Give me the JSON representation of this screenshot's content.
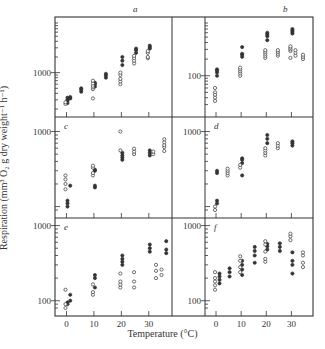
{
  "figure": {
    "ylabel": "Respiration (mm³ O₂ g dry weight⁻¹ h⁻¹)",
    "xlabel": "Temperature (°C)",
    "x_ticks": [
      0,
      10,
      20,
      30
    ],
    "colors": {
      "ink": "#333333",
      "background": "#ffffff"
    }
  },
  "chart_data": [
    {
      "type": "scatter",
      "panel": "a",
      "xlabel": "Temperature (°C)",
      "ylabel": "Respiration",
      "yscale": "log",
      "ylim": [
        200,
        9000
      ],
      "ytick_labels": [
        "1000"
      ],
      "xlim": [
        -2,
        37
      ],
      "series": [
        {
          "name": "filled",
          "points": [
            [
              0,
              260
            ],
            [
              0,
              290
            ],
            [
              0,
              300
            ],
            [
              0,
              330
            ],
            [
              1,
              320
            ],
            [
              1,
              340
            ],
            [
              5,
              430
            ],
            [
              5,
              470
            ],
            [
              5,
              500
            ],
            [
              10,
              540
            ],
            [
              10,
              600
            ],
            [
              10,
              640
            ],
            [
              14,
              800
            ],
            [
              14,
              880
            ],
            [
              14,
              950
            ],
            [
              20,
              1400
            ],
            [
              20,
              1700
            ],
            [
              20,
              2000
            ],
            [
              25,
              2400
            ],
            [
              25,
              2700
            ],
            [
              25,
              2900
            ],
            [
              30,
              2900
            ],
            [
              30,
              3100
            ],
            [
              30,
              3300
            ]
          ]
        },
        {
          "name": "open",
          "points": [
            [
              0,
              250
            ],
            [
              0,
              270
            ],
            [
              10,
              320
            ],
            [
              10,
              480
            ],
            [
              10,
              520
            ],
            [
              10,
              560
            ],
            [
              10,
              620
            ],
            [
              10,
              700
            ],
            [
              20,
              600
            ],
            [
              20,
              680
            ],
            [
              20,
              760
            ],
            [
              20,
              900
            ],
            [
              20,
              1000
            ],
            [
              25,
              1500
            ],
            [
              25,
              1700
            ],
            [
              25,
              1900
            ],
            [
              25,
              2100
            ],
            [
              30,
              1900
            ],
            [
              30,
              2000
            ],
            [
              30,
              2400
            ],
            [
              30,
              2600
            ]
          ]
        }
      ]
    },
    {
      "type": "scatter",
      "panel": "b",
      "xlabel": "Temperature (°C)",
      "ylabel": "Respiration",
      "yscale": "log",
      "ylim": [
        25,
        900
      ],
      "ytick_labels": [
        "100"
      ],
      "xlim": [
        -2,
        37
      ],
      "series": [
        {
          "name": "filled",
          "points": [
            [
              0,
              100
            ],
            [
              0,
              115
            ],
            [
              0,
              125
            ],
            [
              0,
              130
            ],
            [
              10,
              220
            ],
            [
              10,
              240
            ],
            [
              10,
              250
            ],
            [
              10,
              330
            ],
            [
              20,
              520
            ],
            [
              20,
              560
            ],
            [
              20,
              600
            ],
            [
              20,
              440
            ],
            [
              30,
              580
            ],
            [
              30,
              620
            ],
            [
              30,
              660
            ],
            [
              30,
              700
            ]
          ]
        },
        {
          "name": "open",
          "points": [
            [
              0,
              60
            ],
            [
              0,
              50
            ],
            [
              0,
              45
            ],
            [
              0,
              40
            ],
            [
              0,
              35
            ],
            [
              10,
              100
            ],
            [
              10,
              110
            ],
            [
              10,
              120
            ],
            [
              10,
              130
            ],
            [
              10,
              140
            ],
            [
              20,
              210
            ],
            [
              20,
              230
            ],
            [
              20,
              250
            ],
            [
              20,
              270
            ],
            [
              20,
              290
            ],
            [
              25,
              230
            ],
            [
              25,
              250
            ],
            [
              25,
              270
            ],
            [
              25,
              290
            ],
            [
              30,
              210
            ],
            [
              30,
              280
            ],
            [
              30,
              300
            ],
            [
              30,
              320
            ],
            [
              30,
              340
            ],
            [
              32,
              230
            ],
            [
              32,
              260
            ],
            [
              32,
              290
            ],
            [
              35,
              200
            ],
            [
              35,
              220
            ],
            [
              35,
              240
            ]
          ]
        }
      ]
    },
    {
      "type": "scatter",
      "panel": "c",
      "xlabel": "Temperature (°C)",
      "ylabel": "Respiration",
      "yscale": "log",
      "ylim": [
        90,
        1300
      ],
      "ytick_labels": [
        "1000"
      ],
      "xlim": [
        -2,
        37
      ],
      "series": [
        {
          "name": "filled",
          "points": [
            [
              0,
              100
            ],
            [
              0,
              110
            ],
            [
              0,
              120
            ],
            [
              1,
              190
            ],
            [
              10,
              180
            ],
            [
              10,
              190
            ],
            [
              10,
              300
            ],
            [
              10,
              310
            ],
            [
              20,
              420
            ],
            [
              20,
              450
            ],
            [
              20,
              480
            ],
            [
              20,
              520
            ],
            [
              30,
              480
            ],
            [
              30,
              520
            ],
            [
              30,
              560
            ]
          ]
        },
        {
          "name": "open",
          "points": [
            [
              0,
              170
            ],
            [
              0,
              200
            ],
            [
              0,
              230
            ],
            [
              0,
              260
            ],
            [
              10,
              260
            ],
            [
              10,
              280
            ],
            [
              10,
              330
            ],
            [
              10,
              350
            ],
            [
              20,
              560
            ],
            [
              20,
              1000
            ],
            [
              25,
              500
            ],
            [
              25,
              540
            ],
            [
              25,
              590
            ],
            [
              32,
              500
            ],
            [
              32,
              540
            ],
            [
              36,
              550
            ],
            [
              36,
              620
            ],
            [
              36,
              660
            ],
            [
              36,
              720
            ],
            [
              36,
              790
            ]
          ]
        }
      ]
    },
    {
      "type": "scatter",
      "panel": "d",
      "xlabel": "Temperature (°C)",
      "ylabel": "Respiration",
      "yscale": "log",
      "ylim": [
        90,
        1300
      ],
      "ytick_labels": [
        "1000"
      ],
      "xlim": [
        -2,
        37
      ],
      "series": [
        {
          "name": "filled",
          "points": [
            [
              0,
              110
            ],
            [
              0,
              120
            ],
            [
              0,
              280
            ],
            [
              0,
              300
            ],
            [
              10,
              260
            ],
            [
              10,
              380
            ],
            [
              10,
              420
            ],
            [
              10,
              440
            ],
            [
              20,
              700
            ],
            [
              20,
              800
            ],
            [
              20,
              900
            ],
            [
              30,
              650
            ],
            [
              30,
              700
            ],
            [
              30,
              740
            ]
          ]
        },
        {
          "name": "open",
          "points": [
            [
              0,
              90
            ],
            [
              0,
              100
            ],
            [
              5,
              260
            ],
            [
              5,
              280
            ],
            [
              5,
              300
            ],
            [
              5,
              320
            ],
            [
              10,
              330
            ],
            [
              10,
              360
            ],
            [
              20,
              480
            ],
            [
              20,
              520
            ],
            [
              20,
              560
            ],
            [
              20,
              600
            ],
            [
              25,
              600
            ],
            [
              25,
              650
            ],
            [
              25,
              700
            ]
          ]
        }
      ]
    },
    {
      "type": "scatter",
      "panel": "e",
      "xlabel": "Temperature (°C)",
      "ylabel": "Respiration",
      "yscale": "log",
      "ylim": [
        80,
        1050
      ],
      "ytick_labels": [
        "1000",
        "100"
      ],
      "xlim": [
        -2,
        37
      ],
      "series": [
        {
          "name": "filled",
          "points": [
            [
              0,
              90
            ],
            [
              0,
              95
            ],
            [
              1,
              100
            ],
            [
              1,
              120
            ],
            [
              10,
              150
            ],
            [
              10,
              200
            ],
            [
              10,
              220
            ],
            [
              20,
              300
            ],
            [
              20,
              330
            ],
            [
              20,
              360
            ],
            [
              20,
              400
            ],
            [
              30,
              450
            ],
            [
              30,
              500
            ],
            [
              30,
              560
            ],
            [
              36,
              430
            ],
            [
              36,
              480
            ],
            [
              36,
              620
            ]
          ]
        },
        {
          "name": "open",
          "points": [
            [
              0,
              80
            ],
            [
              0,
              90
            ],
            [
              0,
              140
            ],
            [
              10,
              120
            ],
            [
              10,
              130
            ],
            [
              10,
              165
            ],
            [
              20,
              150
            ],
            [
              20,
              165
            ],
            [
              20,
              180
            ],
            [
              20,
              230
            ],
            [
              25,
              150
            ],
            [
              25,
              180
            ],
            [
              25,
              240
            ],
            [
              33,
              200
            ],
            [
              33,
              250
            ],
            [
              33,
              300
            ],
            [
              35,
              220
            ],
            [
              35,
              260
            ]
          ]
        }
      ]
    },
    {
      "type": "scatter",
      "panel": "f",
      "xlabel": "Temperature (°C)",
      "ylabel": "Respiration",
      "yscale": "log",
      "ylim": [
        80,
        1050
      ],
      "ytick_labels": [
        "1000",
        "100"
      ],
      "xlim": [
        -2,
        37
      ],
      "series": [
        {
          "name": "filled",
          "points": [
            [
              1,
              170
            ],
            [
              1,
              190
            ],
            [
              1,
              210
            ],
            [
              1,
              230
            ],
            [
              5,
              210
            ],
            [
              5,
              240
            ],
            [
              5,
              270
            ],
            [
              10,
              220
            ],
            [
              10,
              260
            ],
            [
              10,
              300
            ],
            [
              10,
              340
            ],
            [
              15,
              320
            ],
            [
              15,
              400
            ],
            [
              15,
              460
            ],
            [
              15,
              520
            ],
            [
              20,
              480
            ],
            [
              20,
              530
            ],
            [
              20,
              570
            ],
            [
              25,
              460
            ],
            [
              25,
              520
            ],
            [
              25,
              580
            ],
            [
              30,
              230
            ],
            [
              30,
              300
            ],
            [
              30,
              340
            ],
            [
              30,
              440
            ]
          ]
        },
        {
          "name": "open",
          "points": [
            [
              0,
              140
            ],
            [
              0,
              160
            ],
            [
              0,
              180
            ],
            [
              0,
              200
            ],
            [
              0,
              240
            ],
            [
              10,
              240
            ],
            [
              10,
              280
            ],
            [
              10,
              340
            ],
            [
              10,
              390
            ],
            [
              20,
              330
            ],
            [
              20,
              360
            ],
            [
              20,
              450
            ],
            [
              20,
              560
            ],
            [
              20,
              620
            ],
            [
              30,
              640
            ],
            [
              30,
              720
            ],
            [
              30,
              780
            ],
            [
              35,
              280
            ],
            [
              35,
              320
            ],
            [
              35,
              400
            ],
            [
              35,
              440
            ]
          ]
        }
      ]
    }
  ]
}
